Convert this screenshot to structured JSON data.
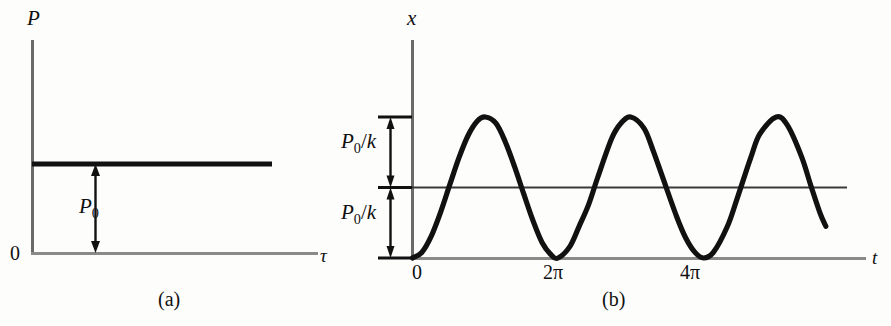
{
  "figure": {
    "background": "#fdfdfc",
    "ink": "#101010",
    "axis_color": "#4a4a4a",
    "curve_color": "#111111",
    "width": 891,
    "height": 326
  },
  "panel_a": {
    "caption": "(a)",
    "y_axis_label": "P",
    "x_axis_label": "τ",
    "origin_label": "0",
    "annotation": {
      "symbol": "P",
      "subscript": "0",
      "full": "P0"
    }
  },
  "panel_b": {
    "caption": "(b)",
    "y_axis_label": "x",
    "x_axis_label": "t",
    "origin_label": "0",
    "x_tick_labels": [
      "2π",
      "4π"
    ],
    "y_annotations": [
      {
        "symbol": "P",
        "subscript": "0",
        "divider": "/",
        "denominator": "k",
        "full": "P0/k"
      },
      {
        "symbol": "P",
        "subscript": "0",
        "divider": "/",
        "denominator": "k",
        "full": "P0/k"
      }
    ]
  },
  "chart_data": [
    {
      "type": "line",
      "title": "(a)",
      "xlabel": "τ",
      "ylabel": "P",
      "description": "Constant applied force P0 versus time tau (step / constant load).",
      "x": [
        0,
        1
      ],
      "values": [
        1,
        1
      ],
      "series": [
        {
          "name": "P(τ) = P0",
          "values": [
            1,
            1
          ]
        }
      ],
      "annotations": [
        {
          "text": "P0",
          "type": "double-arrow",
          "from": 0,
          "to": 1,
          "axis": "y"
        }
      ],
      "xlim": [
        0,
        1.2
      ],
      "ylim": [
        0,
        2.1
      ],
      "grid": false,
      "legend": "none"
    },
    {
      "type": "line",
      "title": "(b)",
      "xlabel": "t",
      "ylabel": "x",
      "description": "Displacement response x(t) = (P0/k)(1 - cos t); oscillates between 0 and 2P0/k about mean P0/k with period 2π.",
      "xtick_values": [
        0,
        6.2832,
        12.5664
      ],
      "xtick_labels": [
        "0",
        "2π",
        "4π"
      ],
      "ytick_values": [
        0,
        1,
        2
      ],
      "ytick_labels": [
        "0",
        "P0/k",
        "2P0/k"
      ],
      "amplitude": 1,
      "mean": 1,
      "period": 6.2832,
      "xlim": [
        0,
        18.2
      ],
      "ylim": [
        0,
        2.6
      ],
      "grid": false,
      "legend": "none",
      "series": [
        {
          "name": "x(t) = (P0/k)(1 - cos t)",
          "x": [
            0.0,
            0.4,
            0.8,
            1.2,
            1.6,
            2.0,
            2.4,
            2.8,
            3.14159,
            3.6,
            4.0,
            4.4,
            4.8,
            5.2,
            5.6,
            6.0,
            6.2832,
            6.8,
            7.2,
            7.6,
            8.0,
            8.6,
            9.0,
            9.42478,
            10.0,
            10.4,
            10.8,
            11.4,
            11.8,
            12.2,
            12.5664,
            13.0,
            13.6,
            14.0,
            14.6,
            15.0,
            15.708,
            16.2,
            16.8,
            17.2,
            17.6,
            17.85
          ],
          "values": [
            0.0,
            0.0789,
            0.3033,
            0.6379,
            1.0292,
            1.4161,
            1.7374,
            1.9423,
            2.0,
            1.9123,
            1.6536,
            1.3023,
            0.9122,
            0.5327,
            0.2167,
            0.0398,
            0.0,
            0.1654,
            0.4528,
            0.7528,
            1.1455,
            1.6948,
            1.9111,
            2.0,
            1.8391,
            1.5167,
            1.1455,
            0.5929,
            0.2845,
            0.0797,
            0.0,
            0.0826,
            0.45,
            0.8239,
            1.4161,
            1.7597,
            2.0,
            1.8776,
            1.4384,
            1.0292,
            0.6379,
            0.45
          ]
        }
      ]
    }
  ]
}
